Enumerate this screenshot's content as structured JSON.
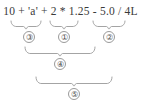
{
  "diagram": {
    "kind": "expression-evaluation-order",
    "colors": {
      "background": "#ffffff",
      "text": "#3a3a3a",
      "brace": "#9a9a9a",
      "circle_border": "#9a9a9a",
      "circle_text": "#4a4a4a"
    },
    "expression": {
      "full_text": "10 + 'a' + 2 * 1.25 - 5.0 / 4L",
      "tokens": [
        {
          "text": "10",
          "kind": "literal"
        },
        {
          "text": "+",
          "kind": "operator"
        },
        {
          "text": "'a'",
          "kind": "literal"
        },
        {
          "text": "+",
          "kind": "operator"
        },
        {
          "text": "2",
          "kind": "literal"
        },
        {
          "text": "*",
          "kind": "operator"
        },
        {
          "text": "1.25",
          "kind": "literal"
        },
        {
          "text": "−",
          "kind": "operator"
        },
        {
          "text": "5.0",
          "kind": "literal"
        },
        {
          "text": "/",
          "kind": "operator"
        },
        {
          "text": "4L",
          "kind": "literal"
        }
      ]
    },
    "groups": [
      {
        "id": "group-3",
        "label": "③",
        "number": 3,
        "level": 1,
        "spans_text": "10 + 'a'",
        "brace": {
          "x1": 11,
          "x2": 41,
          "y_top": 21,
          "y_tip": 29
        },
        "badge": {
          "x": 23,
          "y": 31
        }
      },
      {
        "id": "group-1",
        "label": "①",
        "number": 1,
        "level": 1,
        "spans_text": "2 * 1.25",
        "brace": {
          "x1": 50,
          "x2": 78,
          "y_top": 21,
          "y_tip": 29
        },
        "badge": {
          "x": 58,
          "y": 31
        }
      },
      {
        "id": "group-2",
        "label": "②",
        "number": 2,
        "level": 1,
        "spans_text": "5.0 / 4L",
        "brace": {
          "x1": 93,
          "x2": 125,
          "y_top": 21,
          "y_tip": 29
        },
        "badge": {
          "x": 103,
          "y": 31
        }
      },
      {
        "id": "group-4",
        "label": "④",
        "number": 4,
        "level": 2,
        "spans_text": "10 + 'a' + 2 * 1.25",
        "brace": {
          "x1": 25,
          "x2": 95,
          "y_top": 47,
          "y_tip": 56
        },
        "badge": {
          "x": 54,
          "y": 58
        }
      },
      {
        "id": "group-5",
        "label": "⑤",
        "number": 5,
        "level": 3,
        "spans_text": "10 + 'a' + 2 * 1.25 - 5.0 / 4L",
        "brace": {
          "x1": 36,
          "x2": 112,
          "y_top": 77,
          "y_tip": 86
        },
        "badge": {
          "x": 68,
          "y": 88
        }
      }
    ]
  }
}
